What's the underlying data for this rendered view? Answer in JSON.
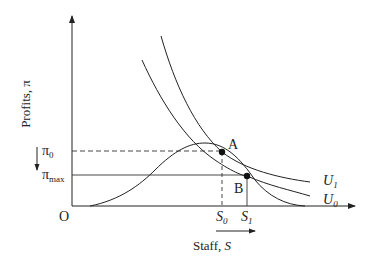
{
  "diagram": {
    "type": "economics-indifference-diagram",
    "axes": {
      "y_label": "Profits, π",
      "x_label_prefix": "Staff, ",
      "x_label_var": "S",
      "origin": "O"
    },
    "y_ticks": {
      "pi0": {
        "base": "π",
        "sub": "0"
      },
      "pimax": {
        "base": "π",
        "sub": "max"
      }
    },
    "x_ticks": {
      "s0": {
        "base": "S",
        "sub": "0"
      },
      "s1": {
        "base": "S",
        "sub": "1"
      }
    },
    "points": {
      "a": "A",
      "b": "B"
    },
    "curves": {
      "u1": {
        "base": "U",
        "sub": "1"
      },
      "u0": {
        "base": "U",
        "sub": "0"
      },
      "profit": "profit function π(S)"
    },
    "annotations": {
      "y_arrow": "down",
      "x_arrow": "right"
    },
    "colors": {
      "line": "#222222",
      "background": "#ffffff"
    }
  }
}
